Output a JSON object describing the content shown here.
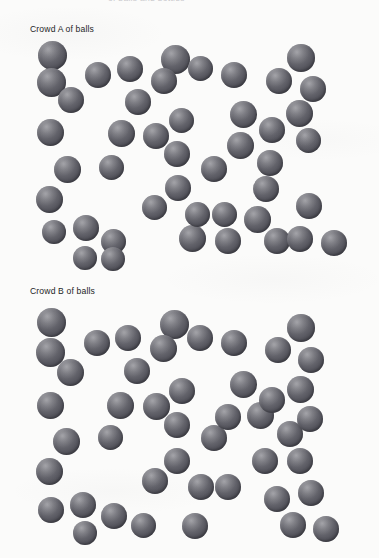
{
  "page": {
    "width": 379,
    "height": 558,
    "background_color": "#fbfbfa",
    "clipped_top_text": "of balls and bottles",
    "text_color": "#1d1d1f"
  },
  "ball_style": {
    "fill_light": "#8e8e93",
    "fill_mid": "#5e5e66",
    "fill_dark": "#424249",
    "highlight_color": "#d7d7dc",
    "diameter_px": 25,
    "highlight_position": "upper-left"
  },
  "crowds": [
    {
      "id": "crowd-a",
      "label": "Crowd A of balls",
      "ball_count": 45,
      "region": {
        "x": 25,
        "y": 38,
        "width": 350,
        "height": 225
      },
      "balls": [
        {
          "x": 13,
          "y": 3,
          "d": 29
        },
        {
          "x": 12,
          "y": 30,
          "d": 29
        },
        {
          "x": 33,
          "y": 49,
          "d": 26
        },
        {
          "x": 12,
          "y": 81,
          "d": 27
        },
        {
          "x": 29,
          "y": 118,
          "d": 27
        },
        {
          "x": 11,
          "y": 148,
          "d": 27
        },
        {
          "x": 17,
          "y": 182,
          "d": 24
        },
        {
          "x": 48,
          "y": 177,
          "d": 26
        },
        {
          "x": 76,
          "y": 191,
          "d": 25
        },
        {
          "x": 60,
          "y": 24,
          "d": 26
        },
        {
          "x": 92,
          "y": 18,
          "d": 26
        },
        {
          "x": 100,
          "y": 51,
          "d": 26
        },
        {
          "x": 83,
          "y": 82,
          "d": 27
        },
        {
          "x": 118,
          "y": 85,
          "d": 26
        },
        {
          "x": 74,
          "y": 117,
          "d": 25
        },
        {
          "x": 144,
          "y": 70,
          "d": 25
        },
        {
          "x": 139,
          "y": 103,
          "d": 26
        },
        {
          "x": 140,
          "y": 137,
          "d": 26
        },
        {
          "x": 117,
          "y": 157,
          "d": 25
        },
        {
          "x": 154,
          "y": 187,
          "d": 27
        },
        {
          "x": 160,
          "y": 164,
          "d": 25
        },
        {
          "x": 187,
          "y": 164,
          "d": 25
        },
        {
          "x": 176,
          "y": 118,
          "d": 26
        },
        {
          "x": 136,
          "y": 7,
          "d": 29
        },
        {
          "x": 126,
          "y": 30,
          "d": 26
        },
        {
          "x": 163,
          "y": 18,
          "d": 25
        },
        {
          "x": 196,
          "y": 24,
          "d": 26
        },
        {
          "x": 241,
          "y": 30,
          "d": 26
        },
        {
          "x": 205,
          "y": 63,
          "d": 27
        },
        {
          "x": 202,
          "y": 94,
          "d": 27
        },
        {
          "x": 234,
          "y": 79,
          "d": 26
        },
        {
          "x": 232,
          "y": 112,
          "d": 26
        },
        {
          "x": 228,
          "y": 138,
          "d": 26
        },
        {
          "x": 219,
          "y": 168,
          "d": 27
        },
        {
          "x": 239,
          "y": 190,
          "d": 26
        },
        {
          "x": 262,
          "y": 6,
          "d": 28
        },
        {
          "x": 275,
          "y": 38,
          "d": 26
        },
        {
          "x": 261,
          "y": 62,
          "d": 27
        },
        {
          "x": 271,
          "y": 90,
          "d": 25
        },
        {
          "x": 271,
          "y": 155,
          "d": 26
        },
        {
          "x": 262,
          "y": 188,
          "d": 26
        },
        {
          "x": 296,
          "y": 192,
          "d": 26
        },
        {
          "x": 190,
          "y": 190,
          "d": 26
        },
        {
          "x": 48,
          "y": 208,
          "d": 24
        },
        {
          "x": 76,
          "y": 209,
          "d": 24
        }
      ]
    },
    {
      "id": "crowd-b",
      "label": "Crowd B of balls",
      "ball_count": 45,
      "region": {
        "x": 25,
        "y": 300,
        "width": 350,
        "height": 254
      },
      "balls": [
        {
          "x": 12,
          "y": 8,
          "d": 29
        },
        {
          "x": 11,
          "y": 38,
          "d": 29
        },
        {
          "x": 32,
          "y": 59,
          "d": 27
        },
        {
          "x": 12,
          "y": 92,
          "d": 27
        },
        {
          "x": 28,
          "y": 128,
          "d": 27
        },
        {
          "x": 11,
          "y": 158,
          "d": 27
        },
        {
          "x": 13,
          "y": 197,
          "d": 26
        },
        {
          "x": 45,
          "y": 192,
          "d": 26
        },
        {
          "x": 76,
          "y": 203,
          "d": 26
        },
        {
          "x": 59,
          "y": 30,
          "d": 26
        },
        {
          "x": 90,
          "y": 25,
          "d": 26
        },
        {
          "x": 99,
          "y": 58,
          "d": 26
        },
        {
          "x": 82,
          "y": 92,
          "d": 27
        },
        {
          "x": 118,
          "y": 93,
          "d": 27
        },
        {
          "x": 73,
          "y": 125,
          "d": 25
        },
        {
          "x": 144,
          "y": 78,
          "d": 26
        },
        {
          "x": 139,
          "y": 112,
          "d": 26
        },
        {
          "x": 139,
          "y": 148,
          "d": 26
        },
        {
          "x": 117,
          "y": 168,
          "d": 26
        },
        {
          "x": 163,
          "y": 174,
          "d": 26
        },
        {
          "x": 190,
          "y": 174,
          "d": 26
        },
        {
          "x": 176,
          "y": 125,
          "d": 26
        },
        {
          "x": 135,
          "y": 10,
          "d": 29
        },
        {
          "x": 125,
          "y": 35,
          "d": 27
        },
        {
          "x": 162,
          "y": 25,
          "d": 26
        },
        {
          "x": 196,
          "y": 30,
          "d": 26
        },
        {
          "x": 240,
          "y": 37,
          "d": 26
        },
        {
          "x": 205,
          "y": 71,
          "d": 27
        },
        {
          "x": 222,
          "y": 102,
          "d": 27
        },
        {
          "x": 234,
          "y": 87,
          "d": 26
        },
        {
          "x": 252,
          "y": 121,
          "d": 26
        },
        {
          "x": 227,
          "y": 148,
          "d": 26
        },
        {
          "x": 262,
          "y": 148,
          "d": 26
        },
        {
          "x": 239,
          "y": 186,
          "d": 26
        },
        {
          "x": 255,
          "y": 212,
          "d": 26
        },
        {
          "x": 262,
          "y": 14,
          "d": 28
        },
        {
          "x": 273,
          "y": 47,
          "d": 26
        },
        {
          "x": 262,
          "y": 76,
          "d": 27
        },
        {
          "x": 272,
          "y": 106,
          "d": 26
        },
        {
          "x": 273,
          "y": 180,
          "d": 26
        },
        {
          "x": 288,
          "y": 216,
          "d": 26
        },
        {
          "x": 157,
          "y": 213,
          "d": 26
        },
        {
          "x": 190,
          "y": 104,
          "d": 26
        },
        {
          "x": 106,
          "y": 213,
          "d": 25
        },
        {
          "x": 48,
          "y": 221,
          "d": 24
        }
      ]
    }
  ]
}
